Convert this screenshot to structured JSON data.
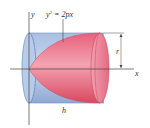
{
  "diagram": {
    "axis_labels": {
      "y": "y",
      "x": "x"
    },
    "equation": {
      "base": "y",
      "exp": "2",
      "rest": " = 2px"
    },
    "dimensions": {
      "radius": "r",
      "height": "h"
    },
    "colors": {
      "cylinder_fill": "#9fb8dc",
      "cylinder_edge": "#6f8fbf",
      "paraboloid_fill": "#e8607a",
      "paraboloid_light": "#f6b3c0",
      "axis": "#444444"
    }
  }
}
